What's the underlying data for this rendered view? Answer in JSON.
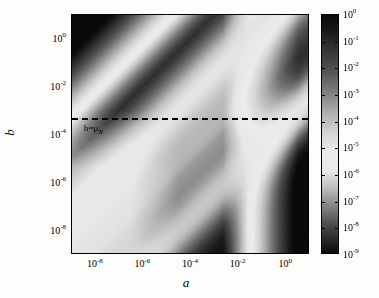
{
  "figure": {
    "type": "heatmap",
    "background_color": "#fdfdfd",
    "axis_color": "#000000"
  },
  "axes": {
    "xlabel": "a",
    "ylabel": "b",
    "x_scale": "log",
    "y_scale": "log",
    "xlim": [
      1e-09,
      10.0
    ],
    "ylim": [
      1e-09,
      10.0
    ],
    "x_ticks": [
      {
        "value": 1e-08,
        "mantissa": "10",
        "exponent": "-8"
      },
      {
        "value": 1e-06,
        "mantissa": "10",
        "exponent": "-6"
      },
      {
        "value": 0.0001,
        "mantissa": "10",
        "exponent": "-4"
      },
      {
        "value": 0.01,
        "mantissa": "10",
        "exponent": "-2"
      },
      {
        "value": 1.0,
        "mantissa": "10",
        "exponent": "0"
      }
    ],
    "y_ticks": [
      {
        "value": 1.0,
        "mantissa": "10",
        "exponent": "0"
      },
      {
        "value": 0.01,
        "mantissa": "10",
        "exponent": "-2"
      },
      {
        "value": 0.0001,
        "mantissa": "10",
        "exponent": "-4"
      },
      {
        "value": 1e-06,
        "mantissa": "10",
        "exponent": "-6"
      },
      {
        "value": 1e-08,
        "mantissa": "10",
        "exponent": "-8"
      }
    ]
  },
  "annotation": {
    "dashed_line": {
      "b_value": 0.0005,
      "style": "dashed",
      "color": "#000000"
    },
    "label_main": "b=μ",
    "label_sub": "N"
  },
  "colorbar": {
    "orientation": "vertical",
    "scale": "log",
    "vmin": 1e-09,
    "vmax": 1.0,
    "colormap": "gray-band (dark-light-dark-light-dark)",
    "ticks": [
      {
        "value": 1.0,
        "mantissa": "10",
        "exponent": "0"
      },
      {
        "value": 0.1,
        "mantissa": "10",
        "exponent": "-1"
      },
      {
        "value": 0.01,
        "mantissa": "10",
        "exponent": "-2"
      },
      {
        "value": 0.001,
        "mantissa": "10",
        "exponent": "-3"
      },
      {
        "value": 0.0001,
        "mantissa": "10",
        "exponent": "-4"
      },
      {
        "value": 1e-05,
        "mantissa": "10",
        "exponent": "-5"
      },
      {
        "value": 1e-06,
        "mantissa": "10",
        "exponent": "-6"
      },
      {
        "value": 1e-07,
        "mantissa": "10",
        "exponent": "-7"
      },
      {
        "value": 1e-08,
        "mantissa": "10",
        "exponent": "-8"
      },
      {
        "value": 1e-09,
        "mantissa": "10",
        "exponent": "-9"
      }
    ]
  },
  "chart_data": {
    "type": "heatmap",
    "title": "",
    "xlabel": "a",
    "ylabel": "b",
    "xscale": "log",
    "yscale": "log",
    "xlim": [
      1e-09,
      10.0
    ],
    "ylim": [
      1e-09,
      10.0
    ],
    "grid": false,
    "legend": "colorbar on right, log scale 1e-9 to 1e0",
    "colorbar_label": "",
    "value_range": [
      1e-09,
      1.0
    ],
    "x_tick_labels": [
      "10^-8",
      "10^-6",
      "10^-4",
      "10^-2",
      "10^0"
    ],
    "y_tick_labels": [
      "10^0",
      "10^-2",
      "10^-4",
      "10^-6",
      "10^-8"
    ],
    "colorbar_tick_labels": [
      "10^0",
      "10^-1",
      "10^-2",
      "10^-3",
      "10^-4",
      "10^-5",
      "10^-6",
      "10^-7",
      "10^-8",
      "10^-9"
    ],
    "annotations": [
      {
        "text": "b=μ_N",
        "type": "dashed-horizontal-line",
        "y_value": 0.0005
      }
    ],
    "grid_nx": 120,
    "grid_ny": 120,
    "sample_points": [
      {
        "a": 1e-08,
        "b": 1.0,
        "value": 0.2
      },
      {
        "a": 1e-06,
        "b": 1.0,
        "value": 3e-06
      },
      {
        "a": 0.0001,
        "b": 1.0,
        "value": 0.0002
      },
      {
        "a": 0.01,
        "b": 1.0,
        "value": 0.08
      },
      {
        "a": 1.0,
        "b": 1.0,
        "value": 0.5
      },
      {
        "a": 1e-08,
        "b": 0.01,
        "value": 2e-06
      },
      {
        "a": 1e-06,
        "b": 0.01,
        "value": 5e-07
      },
      {
        "a": 0.0001,
        "b": 0.01,
        "value": 1e-05
      },
      {
        "a": 0.01,
        "b": 0.01,
        "value": 0.005
      },
      {
        "a": 1.0,
        "b": 0.01,
        "value": 0.6
      },
      {
        "a": 1e-08,
        "b": 0.0001,
        "value": 3e-06
      },
      {
        "a": 1e-06,
        "b": 0.0001,
        "value": 1e-06
      },
      {
        "a": 0.0001,
        "b": 0.0001,
        "value": 0.0001
      },
      {
        "a": 0.01,
        "b": 0.0001,
        "value": 0.2
      },
      {
        "a": 1.0,
        "b": 0.0001,
        "value": 0.8
      },
      {
        "a": 1e-08,
        "b": 1e-06,
        "value": 4e-06
      },
      {
        "a": 1e-06,
        "b": 1e-06,
        "value": 8e-07
      },
      {
        "a": 0.0001,
        "b": 1e-06,
        "value": 0.003
      },
      {
        "a": 0.01,
        "b": 1e-06,
        "value": 0.5
      },
      {
        "a": 1.0,
        "b": 1e-06,
        "value": 0.9
      },
      {
        "a": 1e-08,
        "b": 1e-08,
        "value": 5e-06
      },
      {
        "a": 1e-06,
        "b": 1e-08,
        "value": 6e-07
      },
      {
        "a": 0.0001,
        "b": 1e-08,
        "value": 0.005
      },
      {
        "a": 0.01,
        "b": 1e-08,
        "value": 0.6
      },
      {
        "a": 1.0,
        "b": 1e-08,
        "value": 0.9
      }
    ]
  }
}
